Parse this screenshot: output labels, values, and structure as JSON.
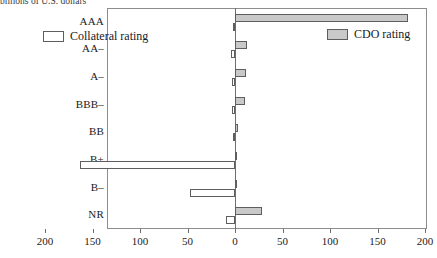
{
  "caption": {
    "text": "billions of U.S. dollars"
  },
  "legend": {
    "position": "inside-top",
    "entries": [
      {
        "key": "collateral",
        "label": "Collateral rating",
        "color": "#ffffff"
      },
      {
        "key": "cdo",
        "label": "CDO rating",
        "color": "#c9c9c9"
      }
    ]
  },
  "axis": {
    "x_ticks": [
      "200",
      "150",
      "100",
      "50",
      "0",
      "50",
      "100",
      "150",
      "200"
    ],
    "x_tick_values": [
      -200,
      -150,
      -100,
      -50,
      0,
      50,
      100,
      150,
      200
    ],
    "y_categories": [
      "AAA",
      "AA–",
      "A–",
      "BBB–",
      "BB",
      "B+",
      "B–",
      "NR"
    ]
  },
  "chart_data": {
    "type": "bar",
    "orientation": "horizontal",
    "style": "diverging",
    "title": "billions of U.S. dollars",
    "xlabel": "",
    "ylabel": "",
    "xlim": [
      -200,
      200
    ],
    "grid": false,
    "legend_position": "inside-top",
    "categories": [
      "AAA",
      "AA–",
      "A–",
      "BBB–",
      "BB",
      "B+",
      "B–",
      "NR"
    ],
    "series": [
      {
        "name": "Collateral rating",
        "side": "left",
        "color": "#ffffff",
        "values": [
          2,
          4,
          3,
          3,
          2,
          163,
          47,
          10
        ]
      },
      {
        "name": "CDO rating",
        "side": "right",
        "color": "#c9c9c9",
        "values": [
          182,
          13,
          12,
          10,
          3,
          2,
          1,
          28
        ]
      }
    ]
  }
}
